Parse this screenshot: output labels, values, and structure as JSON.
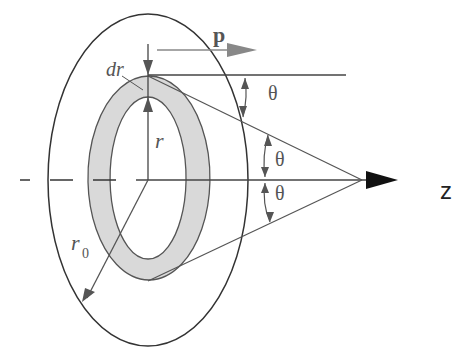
{
  "diagram": {
    "labels": {
      "p": "p",
      "dr": "dr",
      "r": "r",
      "r0_base": "r",
      "r0_sub": "0",
      "theta1": "θ",
      "theta2": "θ",
      "theta3": "θ",
      "z": "z"
    },
    "colors": {
      "outline": "#333333",
      "ring_fill": "#d9d9d9",
      "line": "#555555",
      "axis_arrow": "#111111",
      "p_arrow": "#777777"
    }
  }
}
